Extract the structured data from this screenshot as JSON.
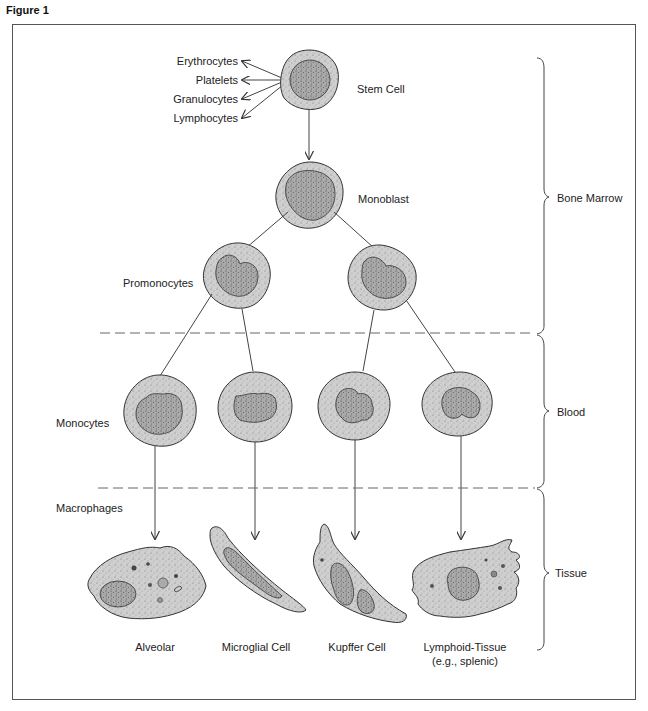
{
  "figure": {
    "title": "Figure 1"
  },
  "stem_cell": {
    "label": "Stem Cell",
    "outputs": [
      "Erythrocytes",
      "Platelets",
      "Granulocytes",
      "Lymphocytes"
    ]
  },
  "stages": {
    "monoblast": "Monoblast",
    "promonocytes": "Promonocytes",
    "monocytes": "Monocytes",
    "macrophages": "Macrophages"
  },
  "macrophage_types": [
    {
      "label": "Alveolar"
    },
    {
      "label": "Microglial Cell"
    },
    {
      "label": "Kupffer Cell"
    },
    {
      "label": "Lymphoid-Tissue",
      "sublabel": "(e.g., splenic)"
    }
  ],
  "regions": [
    {
      "label": "Bone Marrow"
    },
    {
      "label": "Blood"
    },
    {
      "label": "Tissue"
    }
  ],
  "colors": {
    "cytoplasm": "#cfcfcf",
    "nucleus": "#a9a9a9",
    "outline": "#333333",
    "line": "#444444",
    "dashed": "#666666"
  }
}
